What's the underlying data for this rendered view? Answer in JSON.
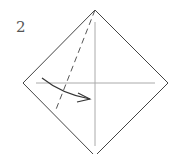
{
  "diagram": {
    "step_number": "2",
    "type": "origami-fold-instruction",
    "colors": {
      "outline": "#444444",
      "crease": "#aaaaaa",
      "dashed": "#555555",
      "arrow": "#333333"
    },
    "shape": {
      "name": "square-diamond",
      "vertices": {
        "top": [
          95,
          10
        ],
        "right": [
          168,
          83
        ],
        "bottom": [
          95,
          156
        ],
        "left": [
          23,
          83
        ]
      }
    },
    "creases": [
      {
        "name": "vertical-crease",
        "from": [
          95,
          22
        ],
        "to": [
          95,
          146
        ]
      },
      {
        "name": "horizontal-crease",
        "from": [
          36,
          83
        ],
        "to": [
          155,
          83
        ]
      }
    ],
    "fold_line": {
      "style": "dashed",
      "from": [
        95,
        10
      ],
      "to": [
        55,
        112
      ]
    },
    "arrow": {
      "direction": "left-to-right",
      "from": [
        42,
        78
      ],
      "to": [
        90,
        99
      ]
    }
  }
}
